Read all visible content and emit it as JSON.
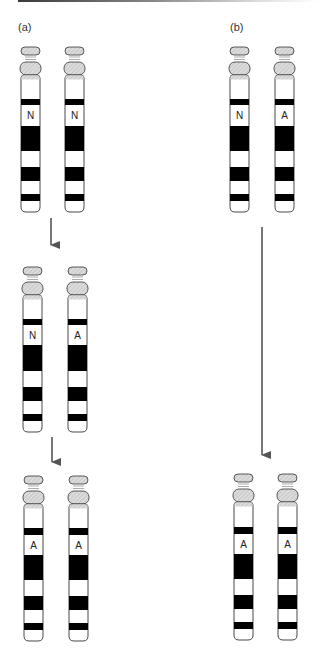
{
  "panels": [
    {
      "label": "(a)",
      "x": 18,
      "y": 21
    },
    {
      "label": "(b)",
      "x": 230,
      "y": 21
    }
  ],
  "colors": {
    "outline": "#333333",
    "band": "#000000",
    "cap_fill": "#d4d4d4",
    "arrow": "#555555",
    "topbar_start": "#3a3a3a"
  },
  "chromosomes": [
    {
      "panel": "a",
      "stage": 1,
      "x": 20,
      "top": 47,
      "label": "N",
      "bands": [
        [
          99,
          105
        ],
        [
          126,
          151
        ],
        [
          167,
          181
        ],
        [
          194,
          201
        ]
      ],
      "label_y": 115,
      "bottom": 212
    },
    {
      "panel": "a",
      "stage": 1,
      "x": 64,
      "top": 47,
      "label": "N",
      "bands": [
        [
          99,
          105
        ],
        [
          126,
          151
        ],
        [
          167,
          181
        ],
        [
          194,
          201
        ]
      ],
      "label_y": 115,
      "bottom": 212
    },
    {
      "panel": "a",
      "stage": 2,
      "x": 22,
      "top": 267,
      "label": "N",
      "bands": [
        [
          319,
          325
        ],
        [
          345,
          371
        ],
        [
          387,
          401
        ],
        [
          414,
          421
        ]
      ],
      "label_y": 335,
      "bottom": 432
    },
    {
      "panel": "a",
      "stage": 2,
      "x": 67,
      "top": 267,
      "label": "A",
      "bands": [
        [
          319,
          325
        ],
        [
          345,
          371
        ],
        [
          387,
          401
        ],
        [
          414,
          421
        ]
      ],
      "label_y": 335,
      "bottom": 432
    },
    {
      "panel": "a",
      "stage": 3,
      "x": 23,
      "top": 476,
      "label": "A",
      "bands": [
        [
          528,
          535
        ],
        [
          555,
          580
        ],
        [
          596,
          610
        ],
        [
          623,
          630
        ]
      ],
      "label_y": 545,
      "bottom": 641
    },
    {
      "panel": "a",
      "stage": 3,
      "x": 68,
      "top": 476,
      "label": "A",
      "bands": [
        [
          528,
          535
        ],
        [
          555,
          580
        ],
        [
          596,
          610
        ],
        [
          623,
          630
        ]
      ],
      "label_y": 545,
      "bottom": 641
    },
    {
      "panel": "b",
      "stage": 1,
      "x": 229,
      "top": 47,
      "label": "N",
      "bands": [
        [
          99,
          105
        ],
        [
          126,
          151
        ],
        [
          167,
          181
        ],
        [
          194,
          201
        ]
      ],
      "label_y": 115,
      "bottom": 212
    },
    {
      "panel": "b",
      "stage": 1,
      "x": 274,
      "top": 47,
      "label": "A",
      "bands": [
        [
          99,
          105
        ],
        [
          126,
          151
        ],
        [
          167,
          181
        ],
        [
          194,
          201
        ]
      ],
      "label_y": 115,
      "bottom": 212
    },
    {
      "panel": "b",
      "stage": 2,
      "x": 233,
      "top": 474,
      "label": "A",
      "bands": [
        [
          527,
          534
        ],
        [
          554,
          579
        ],
        [
          595,
          609
        ],
        [
          622,
          629
        ]
      ],
      "label_y": 544,
      "bottom": 640
    },
    {
      "panel": "b",
      "stage": 2,
      "x": 277,
      "top": 474,
      "label": "A",
      "bands": [
        [
          527,
          534
        ],
        [
          554,
          579
        ],
        [
          595,
          609
        ],
        [
          622,
          629
        ]
      ],
      "label_y": 544,
      "bottom": 640
    }
  ],
  "arrows": [
    {
      "name": "arrow-a-stage1-to-2",
      "x": 51,
      "y1": 218,
      "y2": 255
    },
    {
      "name": "arrow-a-stage2-to-3",
      "x": 52,
      "y1": 437,
      "y2": 472
    },
    {
      "name": "arrow-b-stage1-to-2",
      "x": 262,
      "y1": 227,
      "y2": 465
    }
  ]
}
